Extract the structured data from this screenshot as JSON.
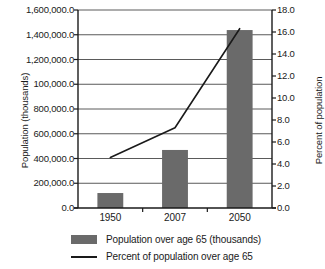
{
  "chart_data": {
    "type": "bar",
    "title": "",
    "categories": [
      "1950",
      "2007",
      "2050"
    ],
    "series": [
      {
        "name": "Population over age 65 (thousands)",
        "type": "bar",
        "axis": "left",
        "color": "#6a6a6a",
        "values": [
          121000,
          469000,
          1438000
        ]
      },
      {
        "name": "Percent of population over age 65",
        "type": "line",
        "axis": "right",
        "color": "#1a1a1a",
        "values": [
          4.6,
          7.3,
          16.3
        ]
      }
    ],
    "xlabel": "",
    "ylabel": "Population (thousands)",
    "y2label": "Percent of population",
    "ylim": [
      0,
      1600000
    ],
    "y2lim": [
      0,
      18
    ],
    "yticks": [
      0,
      200000,
      400000,
      600000,
      800000,
      1000000,
      1200000,
      1400000,
      1600000
    ],
    "ytick_labels": [
      "0.0",
      "200,000.0",
      "400,000.0",
      "600,000.0",
      "800,000.0",
      "100,000.0",
      "1,200,000.0",
      "1,400,000.0",
      "1,600,000.0"
    ],
    "y2ticks": [
      0,
      2,
      4,
      6,
      8,
      10,
      12,
      14,
      16,
      18
    ],
    "y2tick_labels": [
      "0.0",
      "2.0",
      "4.0",
      "6.0",
      "8.0",
      "10.0",
      "12.0",
      "14.0",
      "16.0",
      "18.0"
    ],
    "grid": true,
    "grid_axis": "y",
    "legend_position": "bottom",
    "legend_entries": [
      "Population over age 65 (thousands)",
      "Percent of population over age 65"
    ]
  },
  "axes": {
    "left_title": "Population (thousands)",
    "right_title": "Percent of population"
  },
  "legend": {
    "bar_label": "Population over age 65 (thousands)",
    "line_label": "Percent of population over age 65"
  }
}
